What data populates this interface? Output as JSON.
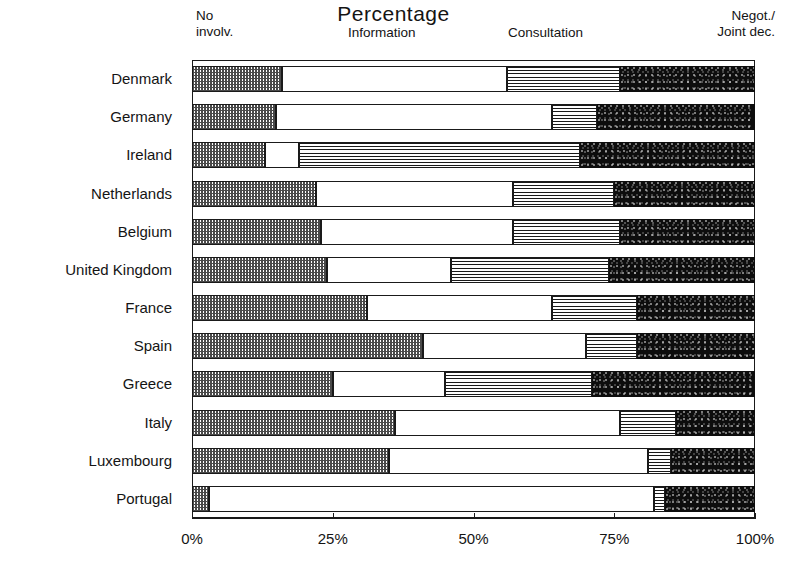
{
  "chart_data": {
    "type": "bar",
    "subtype": "stacked-horizontal-100pct",
    "title": "Percentage",
    "xlabel": "",
    "ylabel": "",
    "xlim": [
      0,
      100
    ],
    "xticks": [
      0,
      25,
      50,
      75,
      100
    ],
    "xtick_labels": [
      "0%",
      "25%",
      "50%",
      "75%",
      "100%"
    ],
    "grid": false,
    "legend_position": "top",
    "legend": [
      {
        "key": "no_involv",
        "label": "No\ninvolv."
      },
      {
        "key": "information",
        "label": "Information"
      },
      {
        "key": "consultation",
        "label": "Consultation"
      },
      {
        "key": "negot",
        "label": "Negot./\nJoint dec."
      }
    ],
    "categories": [
      "Denmark",
      "Germany",
      "Ireland",
      "Netherlands",
      "Belgium",
      "United Kingdom",
      "France",
      "Spain",
      "Greece",
      "Italy",
      "Luxembourg",
      "Portugal"
    ],
    "series": [
      {
        "name": "No involv.",
        "values": [
          16,
          15,
          13,
          22,
          23,
          24,
          31,
          41,
          25,
          36,
          35,
          3
        ]
      },
      {
        "name": "Information",
        "values": [
          40,
          49,
          6,
          35,
          34,
          22,
          33,
          29,
          20,
          40,
          46,
          79
        ]
      },
      {
        "name": "Consultation",
        "values": [
          20,
          8,
          50,
          18,
          19,
          28,
          15,
          9,
          26,
          10,
          4,
          2
        ]
      },
      {
        "name": "Negot./Joint dec.",
        "values": [
          24,
          28,
          31,
          25,
          24,
          26,
          21,
          21,
          29,
          14,
          15,
          16
        ]
      }
    ]
  },
  "colors": {
    "no_involv": "#7a7a7a",
    "information": "#ffffff",
    "consultation": "#b0b0b0",
    "negot": "#0d0d0d",
    "axis": "#1a1a1a",
    "text": "#141414",
    "background": "#ffffff"
  }
}
